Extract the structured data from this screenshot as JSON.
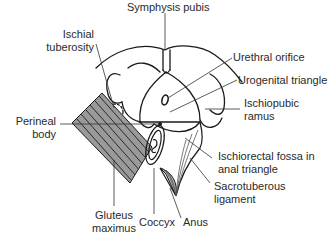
{
  "diagram": {
    "labels": {
      "symphysis_pubis": "Symphysis pubis",
      "ischial_tuberosity_l1": "Ischial",
      "ischial_tuberosity_l2": "tuberosity",
      "urethral_orifice": "Urethral orifice",
      "urogenital_triangle": "Urogenital triangle",
      "ischiopubic_ramus_l1": "Ischiopubic",
      "ischiopubic_ramus_l2": "ramus",
      "perineal_body_l1": "Perineal",
      "perineal_body_l2": "body",
      "ischiorectal_fossa_l1": "Ischiorectal fossa in",
      "ischiorectal_fossa_l2": "anal triangle",
      "sacrotuberous_ligament_l1": "Sacrotuberous",
      "sacrotuberous_ligament_l2": "ligament",
      "gluteus_maximus_l1": "Gluteus",
      "gluteus_maximus_l2": "maximus",
      "coccyx": "Coccyx",
      "anus": "Anus"
    },
    "colors": {
      "line": "#1a1a1a",
      "muscle_fill": "#8c8c8c",
      "ligament_fill": "#b5b5b5",
      "text": "#2a2a2a",
      "background": "#ffffff"
    }
  }
}
